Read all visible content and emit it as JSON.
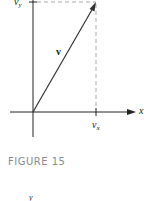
{
  "figure": {
    "caption": "FIGURE 15",
    "vector_label": "v",
    "x_axis_label": "x",
    "vx_base": "v",
    "vx_sub": "x",
    "vy_base": "v",
    "vy_sub": "y",
    "bottom_fragment": "y",
    "colors": {
      "axis": "#222222",
      "vector": "#333333",
      "dashed": "#aaaaaa",
      "caption": "#8a8a8a"
    }
  }
}
